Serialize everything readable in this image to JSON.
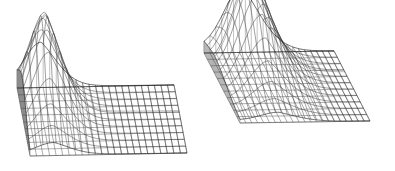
{
  "figure": {
    "title": "",
    "background_color": "#ffffff",
    "line_color": "#2b2b2b",
    "wall_shade_color": "#c9c9c9",
    "width": 395,
    "height": 171,
    "panel_count": 2
  },
  "chart_data": [
    {
      "id": "left-surface",
      "type": "line",
      "render": "3d-wireframe-surface",
      "title": "",
      "subtitle": "",
      "xlabel": "",
      "ylabel": "",
      "zlabel": "",
      "grid": true,
      "legend": null,
      "axis_ticks": [],
      "annotations": [],
      "projection": {
        "origin_x": 30,
        "origin_y": 156,
        "x_axis_dx": 157,
        "x_axis_dy": -3,
        "y_axis_dx": -13,
        "y_axis_dy": -68,
        "z_scale": 96
      },
      "xlim": [
        0,
        1
      ],
      "ylim": [
        0,
        1
      ],
      "zlim": [
        0,
        1
      ],
      "nx": 24,
      "ny": 10,
      "surface": {
        "kind": "ridge-gaussian-decay",
        "peak_x": 0.155,
        "peak_y": 0.62,
        "peak_z": 1.0,
        "sigma_x": 0.105,
        "sigma_y": 0.3,
        "decay_rate": 3.4,
        "ridge_skew": 0.55
      },
      "peak_pixel": [
        55,
        32
      ],
      "base_front_left_pixel": [
        30,
        156
      ],
      "base_front_right_pixel": [
        187,
        154
      ],
      "base_back_left_pixel": [
        18,
        88
      ]
    },
    {
      "id": "right-surface",
      "type": "line",
      "render": "3d-wireframe-surface",
      "title": "",
      "subtitle": "",
      "xlabel": "",
      "ylabel": "",
      "zlabel": "",
      "grid": true,
      "legend": null,
      "axis_ticks": [],
      "annotations": [],
      "projection": {
        "origin_x": 42,
        "origin_y": 123,
        "x_axis_dx": 130,
        "x_axis_dy": -2,
        "y_axis_dx": -36,
        "y_axis_dy": -70,
        "z_scale": 100
      },
      "xlim": [
        0,
        1
      ],
      "ylim": [
        0,
        1
      ],
      "zlim": [
        0,
        1
      ],
      "nx": 22,
      "ny": 11,
      "surface": {
        "kind": "ridge-gaussian-decay",
        "peak_x": 0.3,
        "peak_y": 0.7,
        "peak_z": 1.0,
        "sigma_x": 0.145,
        "sigma_y": 0.32,
        "decay_rate": 3.0,
        "ridge_skew": 0.45
      },
      "peak_pixel": [
        267,
        11
      ],
      "base_front_left_pixel": [
        240,
        123
      ],
      "base_front_right_pixel": [
        370,
        122
      ],
      "base_back_left_pixel": [
        203,
        53
      ]
    }
  ]
}
